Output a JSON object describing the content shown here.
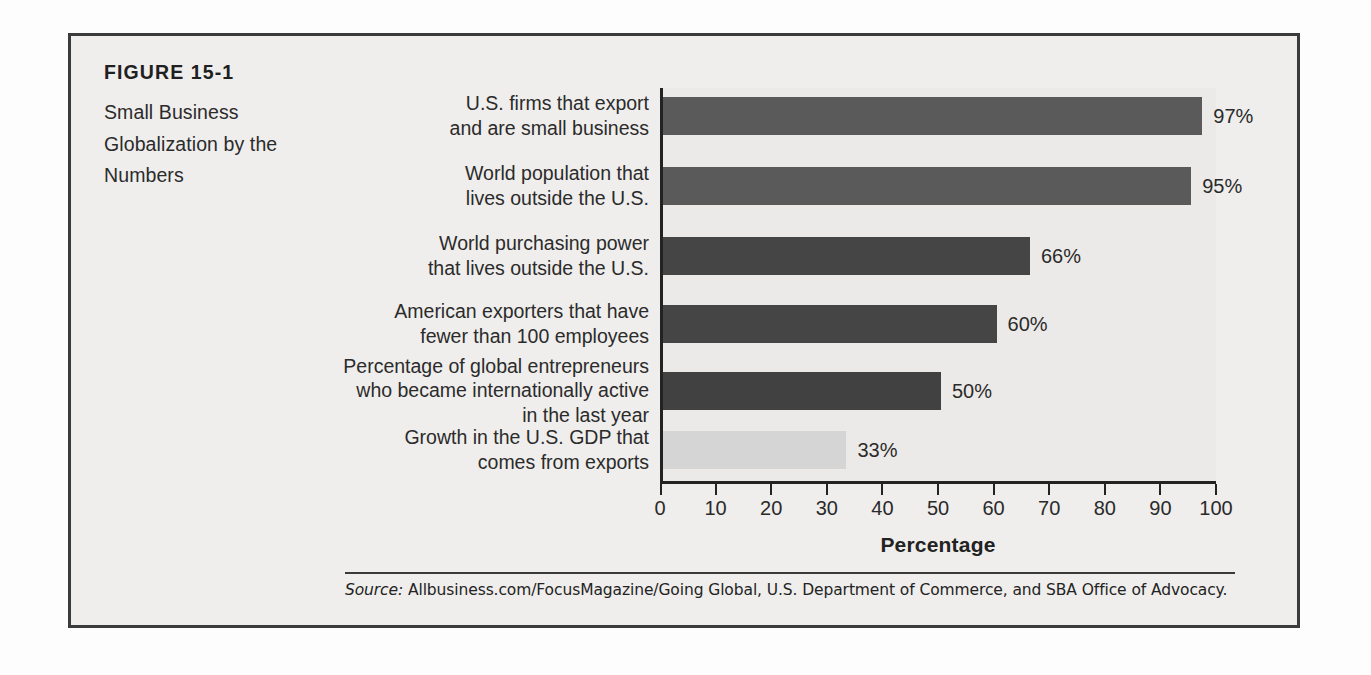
{
  "figure": {
    "number": "FIGURE 15-1",
    "title": "Small Business\nGlobalization by the\nNumbers"
  },
  "source": {
    "label": "Source:",
    "text": " Allbusiness.com/FocusMagazine/Going Global, U.S. Department of Commerce, and SBA Office of Advocacy."
  },
  "colors": {
    "frame": "#3b3b3b",
    "panel_background": "#efeeec",
    "plot_background": "#eceae8",
    "axis": "#232323",
    "bar_medium": "#5a5a5a",
    "bar_dark": "#454545",
    "bar_light": "#d5d5d5",
    "text": "#2b2b2b"
  },
  "chart_data": {
    "type": "bar",
    "orientation": "horizontal",
    "title": "Small Business Globalization by the Numbers",
    "xlabel": "Percentage",
    "ylabel": "",
    "xlim": [
      0,
      100
    ],
    "xticks": [
      0,
      10,
      20,
      30,
      40,
      50,
      60,
      70,
      80,
      90,
      100
    ],
    "xticklabels": [
      "0",
      "10",
      "20",
      "30",
      "40",
      "50",
      "60",
      "70",
      "80",
      "90",
      "100"
    ],
    "grid": false,
    "legend": "none",
    "categories": [
      "U.S. firms that export\nand are small business",
      "World population that\nlives outside the U.S.",
      "World purchasing power\nthat lives outside the U.S.",
      "American exporters that have\nfewer than 100 employees",
      "Percentage of global entrepreneurs\nwho became internationally active\nin the last year",
      "Growth in the U.S. GDP that\ncomes from exports"
    ],
    "values": [
      97,
      95,
      66,
      60,
      50,
      33
    ],
    "data_labels": [
      "97%",
      "95%",
      "66%",
      "60%",
      "50%",
      "33%"
    ],
    "bar_colors": [
      "#5a5a5a",
      "#5a5a5a",
      "#454545",
      "#454545",
      "#414141",
      "#d5d5d5"
    ]
  }
}
